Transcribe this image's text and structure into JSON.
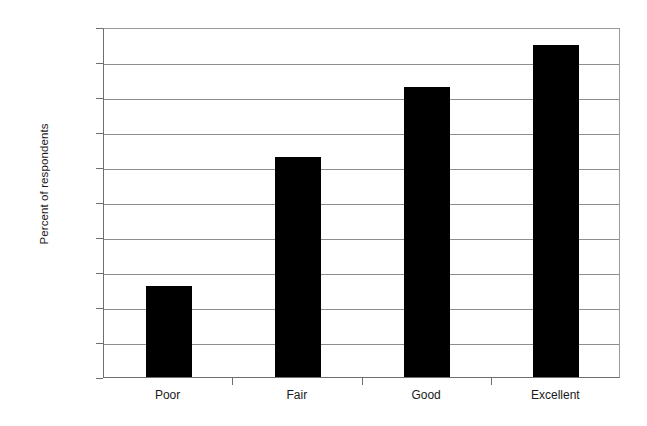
{
  "chart_data": {
    "type": "bar",
    "title": "",
    "subtitle": "",
    "xlabel": "",
    "ylabel": "Percent of respondents",
    "categories": [
      "Poor",
      "Fair",
      "Good",
      "Excellent"
    ],
    "values": [
      26,
      63,
      83,
      95
    ],
    "ylim": [
      0,
      100
    ],
    "ytick_values": [
      0,
      10,
      20,
      30,
      40,
      50,
      60,
      70,
      80,
      90,
      100
    ],
    "ytick_labels": [
      "0%",
      "10%",
      "20%",
      "30%",
      "40%",
      "50%",
      "60%",
      "70%",
      "80%",
      "90%",
      "100%"
    ],
    "grid": true,
    "grid_axis": "y",
    "legend": false,
    "legend_position": "none",
    "bar_color": "#000000",
    "gridline_color": "#8d8d8d",
    "axis_color": "#6e6e6e",
    "background_color": "#ffffff",
    "value_labels_shown": false
  }
}
